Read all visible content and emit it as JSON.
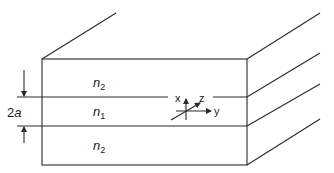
{
  "diagram": {
    "type": "slab-waveguide",
    "layers": [
      {
        "id": "cladding-top",
        "label": "n",
        "subscript": "2"
      },
      {
        "id": "core",
        "label": "n",
        "subscript": "1"
      },
      {
        "id": "cladding-bottom",
        "label": "n",
        "subscript": "2"
      }
    ],
    "dimension": {
      "label_num": "2",
      "label_var": "a"
    },
    "axes": {
      "x": "x",
      "y": "y",
      "z": "z"
    },
    "colors": {
      "line": "#2a2a2a",
      "background": "#ffffff"
    }
  }
}
